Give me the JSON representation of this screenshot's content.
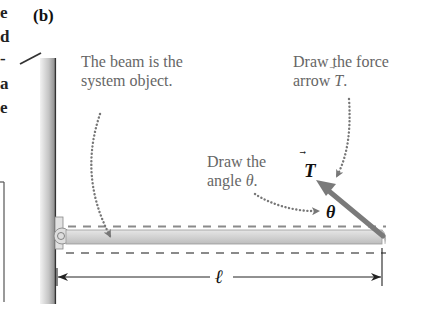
{
  "panel_label": "(b)",
  "left_fragments": [
    "e",
    "d",
    "-",
    "a",
    "e"
  ],
  "annotations": {
    "beam_note": {
      "line1": "The beam is the",
      "line2": "system object."
    },
    "force_note": {
      "line1": "Draw the force",
      "line2_prefix": "arrow ",
      "line2_symbol": "T",
      "line2_suffix": "."
    },
    "angle_note": {
      "line1": "Draw the",
      "line2_prefix": "angle ",
      "line2_symbol": "θ",
      "line2_suffix": "."
    }
  },
  "symbols": {
    "tension": "T",
    "angle": "θ",
    "length": "ℓ"
  },
  "colors": {
    "wall": "#9a9a9a",
    "beam_fill": "#d6d6d6",
    "dashed_outline": "#8a8a8a",
    "force_arrow": "#7a7a7a",
    "note_text": "#666666",
    "dotted_pointer": "#777777"
  }
}
